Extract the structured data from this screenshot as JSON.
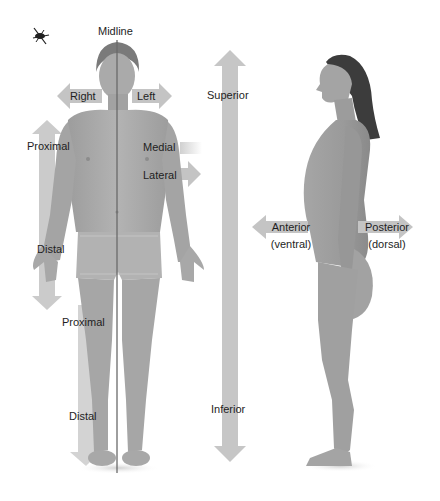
{
  "figure": {
    "type": "anatomical-directional-terms",
    "colors": {
      "background": "#ffffff",
      "arrow": "#c4c4c4",
      "arrow_light": "#dedede",
      "skin_front": "#a9a9a9",
      "skin_side": "#9d9d9d",
      "hair": "#3a3a3a",
      "midline": "#6a6a6a",
      "text": "#1e1e1e"
    }
  },
  "labels": {
    "midline": "Midline",
    "right": "Right",
    "left": "Left",
    "superior": "Superior",
    "inferior": "Inferior",
    "proximal_arm": "Proximal",
    "distal_arm": "Distal",
    "medial": "Medial",
    "lateral": "Lateral",
    "proximal_leg": "Proximal",
    "distal_leg": "Distal",
    "anterior": "Anterior",
    "anterior_sub": "(ventral)",
    "posterior": "Posterior",
    "posterior_sub": "(dorsal)"
  }
}
